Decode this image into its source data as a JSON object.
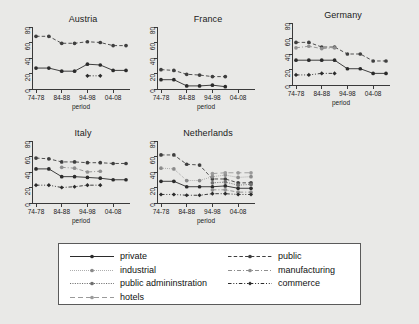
{
  "figure": {
    "background_color": "#e9e9e7",
    "panel_background_color": "#ffffff",
    "axis_color": "#3a3a3a",
    "xlabel": "period",
    "ytick_labels": [
      "0",
      "20",
      "40",
      "60",
      "80"
    ],
    "xtick_labels": [
      "74-78",
      "84-88",
      "94-98",
      "04-08"
    ]
  },
  "legend": {
    "entries": [
      {
        "label": "private",
        "style": "solid",
        "color": "#2b2b2b",
        "marker": "circle-filled"
      },
      {
        "label": "industrial",
        "style": "dotted-fine",
        "color": "#8a8a8a",
        "marker": "circle-filled"
      },
      {
        "label": "public admininstration",
        "style": "dotted",
        "color": "#6f6f6f",
        "marker": "circle-filled"
      },
      {
        "label": "hotels",
        "style": "long-dash",
        "color": "#9a9a9a",
        "marker": "circle-filled"
      },
      {
        "label": "public",
        "style": "dash",
        "color": "#3f3f3f",
        "marker": "circle-filled"
      },
      {
        "label": "manufacturing",
        "style": "dash-dot",
        "color": "#8f8f8f",
        "marker": "circle-filled"
      },
      {
        "label": "commerce",
        "style": "dash-dot-dot",
        "color": "#2b2b2b",
        "marker": "diamond-filled"
      }
    ]
  },
  "chart_data": {
    "type": "line",
    "title": "",
    "xlabel": "period",
    "ylabel": "",
    "ylim": [
      0,
      80
    ],
    "yticks": [
      0,
      20,
      40,
      60,
      80
    ],
    "grid": false,
    "legend_position": "bottom",
    "x": [
      "74-78",
      "79-83",
      "84-88",
      "89-93",
      "94-98",
      "99-03",
      "04-08",
      "09-13"
    ],
    "xtick_positions": [
      "74-78",
      "84-88",
      "94-98",
      "04-08"
    ],
    "panels": [
      {
        "title": "Austria",
        "series": [
          {
            "name": "private",
            "values": [
              27,
              27,
              23,
              23,
              32,
              31,
              24,
              24
            ]
          },
          {
            "name": "public",
            "values": [
              68,
              68,
              59,
              59,
              61,
              60,
              56,
              56
            ]
          },
          {
            "name": "commerce",
            "values": [
              null,
              null,
              null,
              null,
              17,
              17,
              null,
              null
            ]
          }
        ]
      },
      {
        "title": "France",
        "series": [
          {
            "name": "private",
            "values": [
              12,
              12,
              4,
              4,
              5,
              3,
              null,
              null
            ]
          },
          {
            "name": "public",
            "values": [
              25,
              24,
              19,
              18,
              16,
              16,
              null,
              null
            ]
          }
        ]
      },
      {
        "title": "Germany",
        "series": [
          {
            "name": "private",
            "values": [
              32,
              32,
              32,
              32,
              21,
              21,
              15,
              15
            ]
          },
          {
            "name": "public",
            "values": [
              55,
              55,
              49,
              49,
              40,
              40,
              31,
              31
            ]
          },
          {
            "name": "manufacturing",
            "values": [
              48,
              50,
              47,
              48,
              null,
              null,
              null,
              null
            ]
          },
          {
            "name": "commerce",
            "values": [
              13,
              13,
              15,
              15,
              null,
              null,
              null,
              null
            ]
          }
        ]
      },
      {
        "title": "Italy",
        "series": [
          {
            "name": "private",
            "values": [
              44,
              44,
              34,
              34,
              33,
              32,
              30,
              30
            ]
          },
          {
            "name": "public",
            "values": [
              58,
              57,
              53,
              53,
              52,
              52,
              51,
              51
            ]
          },
          {
            "name": "manufacturing",
            "values": [
              null,
              null,
              46,
              45,
              40,
              41,
              null,
              null
            ]
          },
          {
            "name": "commerce",
            "values": [
              23,
              23,
              20,
              21,
              23,
              23,
              null,
              null
            ]
          }
        ]
      },
      {
        "title": "Netherlands",
        "series": [
          {
            "name": "private",
            "values": [
              28,
              28,
              21,
              21,
              21,
              22,
              19,
              19
            ]
          },
          {
            "name": "public",
            "values": [
              62,
              62,
              50,
              49,
              31,
              31,
              26,
              26
            ]
          },
          {
            "name": "industrial",
            "values": [
              45,
              44,
              29,
              29,
              34,
              36,
              33,
              34
            ]
          },
          {
            "name": "public admininstration",
            "values": [
              null,
              null,
              null,
              null,
              26,
              27,
              23,
              24
            ]
          },
          {
            "name": "hotels",
            "values": [
              null,
              null,
              null,
              null,
              38,
              39,
              39,
              39
            ]
          },
          {
            "name": "manufacturing",
            "values": [
              null,
              null,
              null,
              null,
              17,
              17,
              14,
              14
            ]
          },
          {
            "name": "commerce",
            "values": [
              11,
              11,
              10,
              10,
              12,
              12,
              11,
              11
            ]
          }
        ]
      }
    ]
  }
}
